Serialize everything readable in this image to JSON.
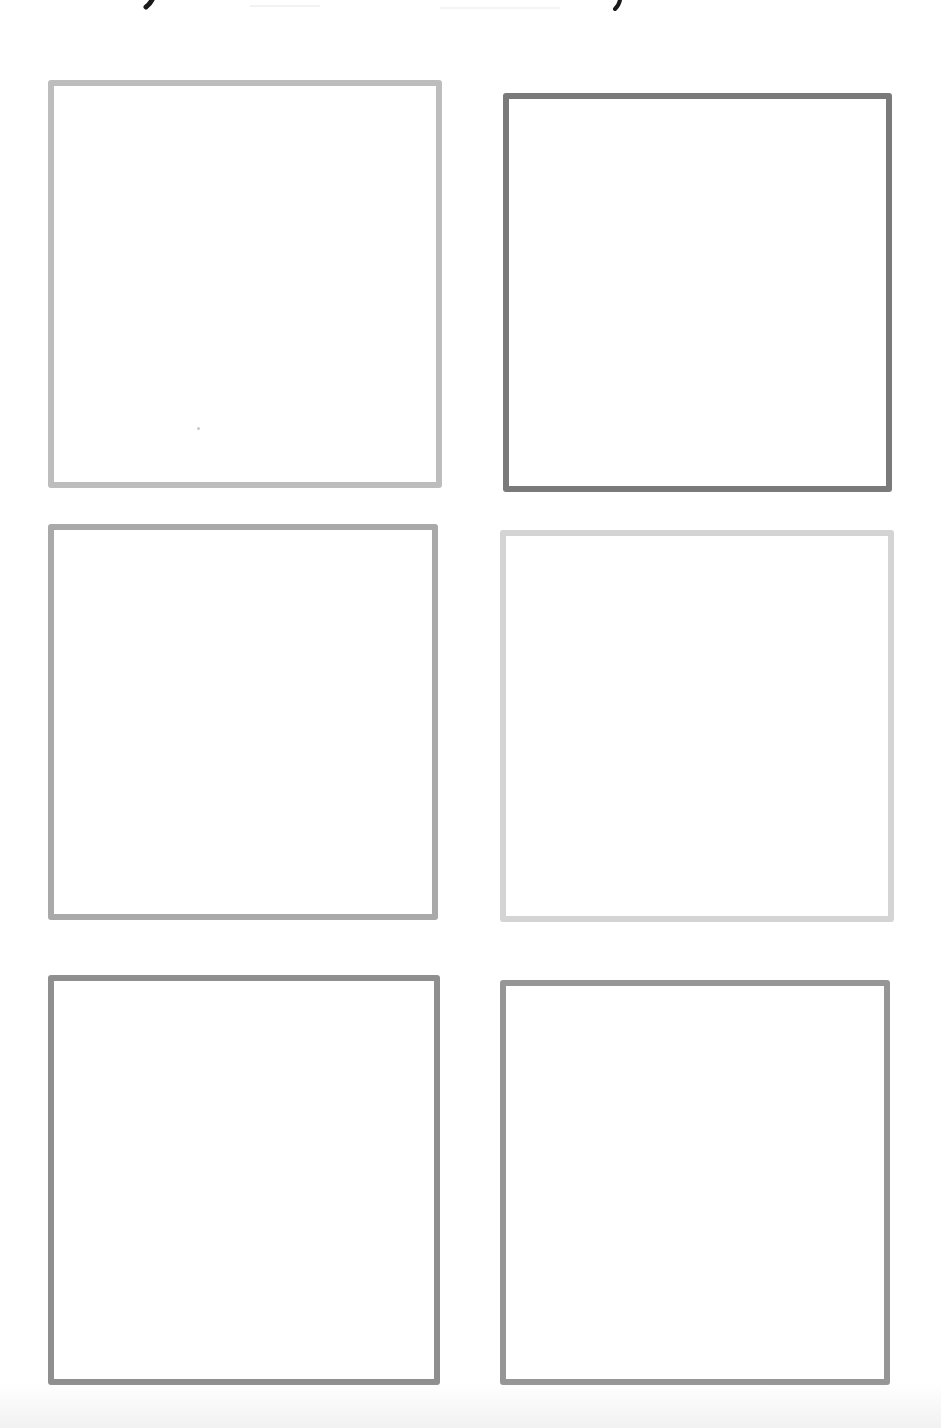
{
  "page": {
    "background": "#ffffff",
    "width": 941,
    "height": 1428
  },
  "header": {
    "text_visible": "",
    "note": "Handwritten header text cropped at top edge; only descender strokes visible",
    "stroke_color": "#1a1a1a"
  },
  "boxes": [
    {
      "id": 1,
      "position": "row-1-left",
      "left": 48,
      "top": 80,
      "width": 394,
      "height": 408,
      "border_color": "#bdbdbd",
      "border_width": 6
    },
    {
      "id": 2,
      "position": "row-1-right",
      "left": 503,
      "top": 93,
      "width": 389,
      "height": 399,
      "border_color": "#7a7a7a",
      "border_width": 6
    },
    {
      "id": 3,
      "position": "row-2-left",
      "left": 48,
      "top": 524,
      "width": 390,
      "height": 396,
      "border_color": "#a9a9a9",
      "border_width": 6
    },
    {
      "id": 4,
      "position": "row-2-right",
      "left": 500,
      "top": 530,
      "width": 394,
      "height": 392,
      "border_color": "#d4d4d4",
      "border_width": 6
    },
    {
      "id": 5,
      "position": "row-3-left",
      "left": 48,
      "top": 975,
      "width": 392,
      "height": 410,
      "border_color": "#8f8f8f",
      "border_width": 6
    },
    {
      "id": 6,
      "position": "row-3-right",
      "left": 500,
      "top": 980,
      "width": 390,
      "height": 405,
      "border_color": "#969696",
      "border_width": 6
    }
  ]
}
